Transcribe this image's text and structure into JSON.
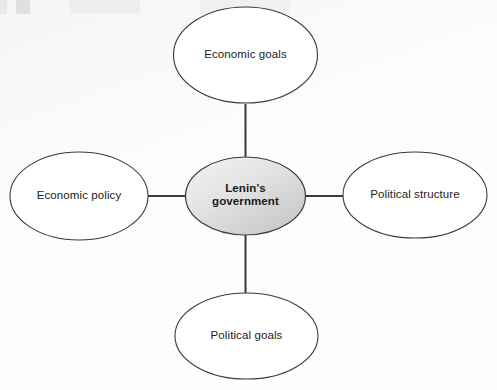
{
  "diagram": {
    "type": "spider-web-concept-map",
    "center": {
      "id": "center",
      "label": "Lenin's\ngovernment",
      "shape": "ellipse",
      "fill_start": "#eeeeee",
      "fill_end": "#c8c8c8",
      "stroke": "#3a3a3a",
      "cx": 245.5,
      "cy": 196,
      "rx": 60,
      "ry": 39
    },
    "nodes": [
      {
        "id": "economic-goals",
        "label": "Economic goals",
        "position": "top",
        "shape": "ellipse",
        "fill": "#ffffff",
        "stroke": "#3a3a3a",
        "cx": 245.5,
        "cy": 55,
        "rx": 72,
        "ry": 48
      },
      {
        "id": "economic-policy",
        "label": "Economic policy",
        "position": "left",
        "shape": "ellipse",
        "fill": "#ffffff",
        "stroke": "#3a3a3a",
        "cx": 79,
        "cy": 196,
        "rx": 69,
        "ry": 44
      },
      {
        "id": "political-structure",
        "label": "Political structure",
        "position": "right",
        "shape": "ellipse",
        "fill": "#ffffff",
        "stroke": "#3a3a3a",
        "cx": 415,
        "cy": 195,
        "rx": 72,
        "ry": 43
      },
      {
        "id": "political-goals",
        "label": "Political goals",
        "position": "bottom",
        "shape": "ellipse",
        "fill": "#ffffff",
        "stroke": "#3a3a3a",
        "cx": 246.5,
        "cy": 336,
        "rx": 71.5,
        "ry": 43
      }
    ],
    "connectors": [
      {
        "id": "center-to-top",
        "from": "center",
        "to": "economic-goals",
        "orientation": "vertical",
        "stroke": "#3a3a3a",
        "width": 2
      },
      {
        "id": "center-to-left",
        "from": "center",
        "to": "economic-policy",
        "orientation": "horizontal",
        "stroke": "#3a3a3a",
        "width": 2
      },
      {
        "id": "center-to-right",
        "from": "center",
        "to": "political-structure",
        "orientation": "horizontal",
        "stroke": "#3a3a3a",
        "width": 2
      },
      {
        "id": "center-to-bottom",
        "from": "center",
        "to": "political-goals",
        "orientation": "vertical",
        "stroke": "#3a3a3a",
        "width": 2
      }
    ],
    "colors": {
      "background": "#fdfdfd",
      "outline": "#3a3a3a",
      "text": "#1b1b1b",
      "center_fill_light": "#eeeeee",
      "center_fill_dark": "#c8c8c8"
    }
  }
}
